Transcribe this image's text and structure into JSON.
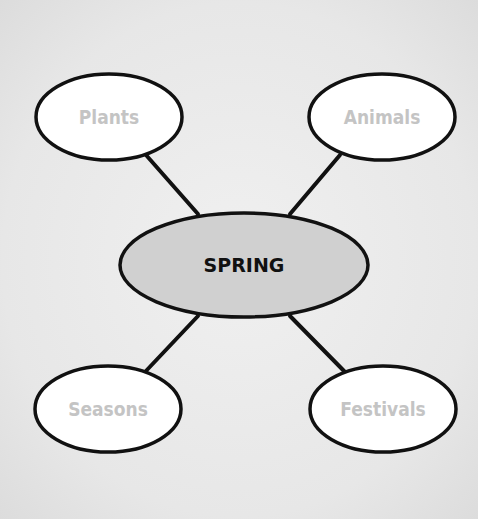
{
  "diagram": {
    "type": "mind-map",
    "center": {
      "label": "SPRING",
      "fill": "#d0d0d0"
    },
    "branches": [
      {
        "id": "plants",
        "label": "Plants"
      },
      {
        "id": "animals",
        "label": "Animals"
      },
      {
        "id": "seasons",
        "label": "Seasons"
      },
      {
        "id": "festivals",
        "label": "Festivals"
      }
    ],
    "colors": {
      "background": "#e8e8e8",
      "node_fill": "#ffffff",
      "outline": "#111111",
      "branch_text": "#c4c4c4",
      "center_text": "#111111"
    }
  }
}
